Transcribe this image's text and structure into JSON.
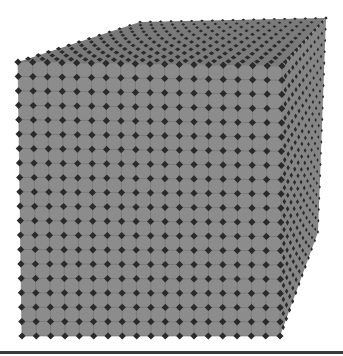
{
  "figure": {
    "colors": {
      "background": "#ffffff",
      "cell_face": "#8c8c8c",
      "cell_edge": "#6e6e6e",
      "junction": "#2a2a2a",
      "top_face": "#7a7a7a",
      "side_face": "#858585",
      "baseline": "#3a3a3a"
    },
    "lattice": {
      "front_columns": 18,
      "front_rows": 19,
      "depth_layers": 12
    },
    "outline": {
      "front_face": [
        [
          18,
          62
        ],
        [
          282,
          66
        ],
        [
          280,
          336
        ],
        [
          22,
          336
        ]
      ],
      "top_face": [
        [
          18,
          62
        ],
        [
          140,
          22
        ],
        [
          326,
          18
        ],
        [
          282,
          66
        ]
      ],
      "right_face": [
        [
          282,
          66
        ],
        [
          326,
          18
        ],
        [
          318,
          232
        ],
        [
          280,
          336
        ]
      ]
    }
  }
}
